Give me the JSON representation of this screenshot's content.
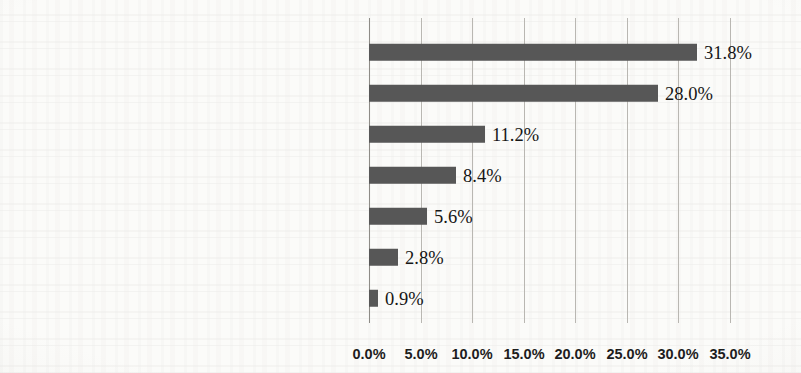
{
  "chart_data": {
    "type": "bar",
    "orientation": "horizontal",
    "title": "",
    "xlabel": "",
    "ylabel": "",
    "categories": [
      "Entertainment",
      "Knowledge",
      "Positive energy",
      "Intelligent recommendation",
      "Music",
      "Social",
      "Commercial"
    ],
    "values": [
      31.8,
      28.0,
      11.2,
      8.4,
      5.6,
      2.8,
      0.9
    ],
    "data_labels": [
      "31.8%",
      "28.0%",
      "11.2%",
      "8.4%",
      "5.6%",
      "2.8%",
      "0.9%"
    ],
    "xlim": [
      0,
      35
    ],
    "xticks": [
      0,
      5,
      10,
      15,
      20,
      25,
      30,
      35
    ],
    "xtick_labels": [
      "0.0%",
      "5.0%",
      "10.0%",
      "15.0%",
      "20.0%",
      "25.0%",
      "30.0%",
      "35.0%"
    ],
    "grid": true,
    "grid_axis": "x",
    "legend": false,
    "series": [
      {
        "name": "Share",
        "values": [
          31.8,
          28.0,
          11.2,
          8.4,
          5.6,
          2.8,
          0.9
        ]
      }
    ],
    "units": "percent"
  },
  "style": {
    "bar_color": "#575757",
    "grid_color": "#b9b7b2",
    "axis_color": "#8e8c87",
    "text_color": "#161616",
    "background": "#fbfbf9"
  }
}
